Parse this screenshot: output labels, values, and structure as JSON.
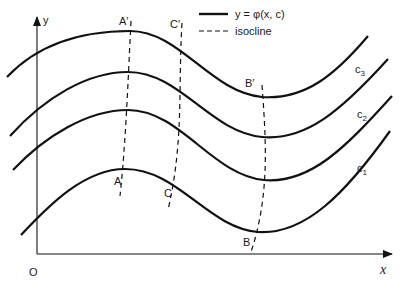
{
  "figure": {
    "axes": {
      "x_label": "x",
      "y_label": "y",
      "origin_label": "O"
    },
    "legend": {
      "solid_label": "y = φ(x, c)",
      "dashed_label": "isocline"
    },
    "curves": [
      {
        "name": "top",
        "label": ""
      },
      {
        "name": "c3",
        "label": "c",
        "sub": "3"
      },
      {
        "name": "c2",
        "label": "c",
        "sub": "2"
      },
      {
        "name": "c1",
        "label": "c",
        "sub": "1"
      }
    ],
    "isoclines": [
      {
        "name": "A",
        "top_label": "A′",
        "bottom_label": "A"
      },
      {
        "name": "C",
        "top_label": "C′",
        "bottom_label": "C"
      },
      {
        "name": "B",
        "top_label": "B′",
        "bottom_label": "B"
      }
    ]
  }
}
